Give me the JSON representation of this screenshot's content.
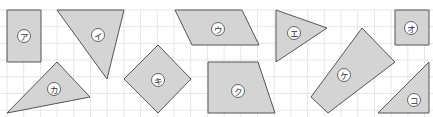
{
  "diagram": {
    "grid": {
      "cell_px": 16.7,
      "color": "#e6e6e6",
      "x0": 7,
      "y0": 10,
      "cols": 26,
      "rows": 7
    },
    "colors": {
      "shape_fill": "#d4d4d4",
      "shape_stroke": "#555555",
      "label_bg": "#ffffff"
    },
    "shapes": [
      {
        "id": "a",
        "label": "ア",
        "kind": "rectangle",
        "points": [
          [
            7,
            10
          ],
          [
            41,
            10
          ],
          [
            41,
            62
          ],
          [
            7,
            62
          ]
        ],
        "label_pos": [
          24,
          36
        ]
      },
      {
        "id": "i",
        "label": "イ",
        "kind": "triangle",
        "points": [
          [
            57,
            10
          ],
          [
            124,
            10
          ],
          [
            107,
            79
          ]
        ],
        "label_pos": [
          98,
          35
        ]
      },
      {
        "id": "u",
        "label": "ウ",
        "kind": "parallelogram",
        "points": [
          [
            175,
            10
          ],
          [
            242,
            10
          ],
          [
            259,
            45
          ],
          [
            192,
            45
          ]
        ],
        "label_pos": [
          218,
          29
        ]
      },
      {
        "id": "e",
        "label": "エ",
        "kind": "triangle",
        "points": [
          [
            276,
            10
          ],
          [
            327,
            28
          ],
          [
            276,
            62
          ]
        ],
        "label_pos": [
          294,
          33
        ]
      },
      {
        "id": "o",
        "label": "オ",
        "kind": "square",
        "points": [
          [
            395,
            10
          ],
          [
            429,
            10
          ],
          [
            429,
            45
          ],
          [
            395,
            45
          ]
        ],
        "label_pos": [
          411,
          28
        ]
      },
      {
        "id": "ka",
        "label": "カ",
        "kind": "triangle",
        "points": [
          [
            7,
            113
          ],
          [
            57,
            62
          ],
          [
            90,
            97
          ]
        ],
        "label_pos": [
          54,
          89
        ]
      },
      {
        "id": "ki",
        "label": "キ",
        "kind": "rhombus",
        "points": [
          [
            158,
            45
          ],
          [
            191,
            79
          ],
          [
            158,
            113
          ],
          [
            124,
            79
          ]
        ],
        "label_pos": [
          158,
          80
        ]
      },
      {
        "id": "ku",
        "label": "ク",
        "kind": "trapezoid",
        "points": [
          [
            208,
            62
          ],
          [
            258,
            62
          ],
          [
            275,
            113
          ],
          [
            208,
            113
          ]
        ],
        "label_pos": [
          238,
          91
        ]
      },
      {
        "id": "ke",
        "label": "ケ",
        "kind": "quadrilateral",
        "points": [
          [
            362,
            28
          ],
          [
            395,
            62
          ],
          [
            328,
            113
          ],
          [
            311,
            97
          ]
        ],
        "label_pos": [
          344,
          75
        ]
      },
      {
        "id": "ko",
        "label": "コ",
        "kind": "triangle",
        "points": [
          [
            429,
            62
          ],
          [
            429,
            113
          ],
          [
            378,
            113
          ]
        ],
        "label_pos": [
          414,
          100
        ]
      }
    ]
  }
}
